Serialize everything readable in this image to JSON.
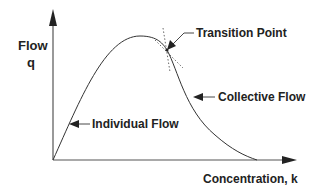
{
  "diagram": {
    "y_axis": {
      "label": "Flow",
      "symbol": "q"
    },
    "x_axis": {
      "label": "Concentration,  k"
    },
    "annotations": {
      "transition": "Transition Point",
      "collective": "Collective Flow",
      "individual": "Individual Flow"
    },
    "colors": {
      "line": "#333333",
      "text": "#222222",
      "background": "#ffffff"
    }
  }
}
